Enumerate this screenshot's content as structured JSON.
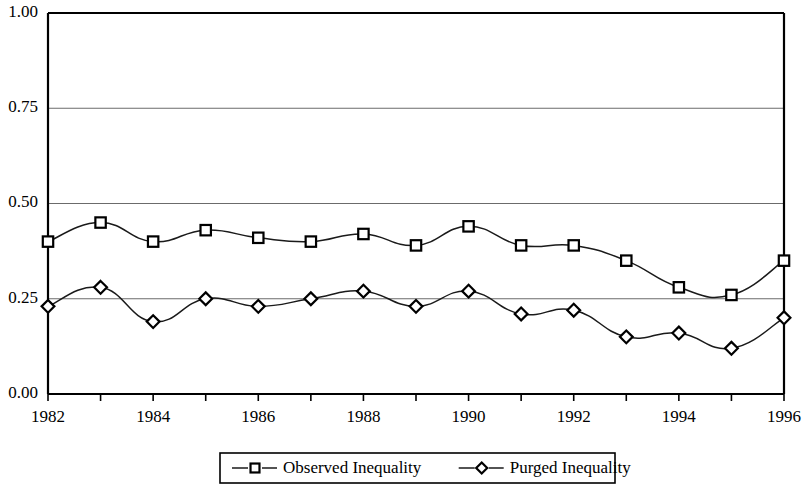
{
  "chart_data": {
    "type": "line",
    "title": "",
    "xlabel": "",
    "ylabel": "",
    "x": [
      1982,
      1983,
      1984,
      1985,
      1986,
      1987,
      1988,
      1989,
      1990,
      1991,
      1992,
      1993,
      1994,
      1995,
      1996
    ],
    "xlim": [
      1982,
      1996
    ],
    "ylim": [
      0.0,
      1.0
    ],
    "grid": true,
    "gridlines": [
      0.25,
      0.5,
      0.75
    ],
    "legend_position": "bottom",
    "y_tick_labels": [
      "1.00",
      "0.75",
      "0.50",
      "0.25",
      "0.00"
    ],
    "y_tick_values": [
      1.0,
      0.75,
      0.5,
      0.25,
      0.0
    ],
    "x_tick_values": [
      1982,
      1983,
      1984,
      1985,
      1986,
      1987,
      1988,
      1989,
      1990,
      1991,
      1992,
      1993,
      1994,
      1995,
      1996
    ],
    "x_tick_labels": [
      "1982",
      "",
      "1984",
      "",
      "1986",
      "",
      "1988",
      "",
      "1990",
      "",
      "1992",
      "",
      "1994",
      "",
      "1996"
    ],
    "x_labeled_years": [
      "1982",
      "1984",
      "1986",
      "1988",
      "1990",
      "1992",
      "1994",
      "1996"
    ],
    "series": [
      {
        "name": "Observed Inequality",
        "marker": "square",
        "color": "#1a1a1a",
        "values": [
          0.4,
          0.45,
          0.4,
          0.43,
          0.41,
          0.4,
          0.42,
          0.39,
          0.44,
          0.39,
          0.39,
          0.35,
          0.28,
          0.26,
          0.35
        ]
      },
      {
        "name": "Purged Inequality",
        "marker": "diamond",
        "color": "#1a1a1a",
        "values": [
          0.23,
          0.28,
          0.19,
          0.25,
          0.23,
          0.25,
          0.27,
          0.23,
          0.27,
          0.21,
          0.22,
          0.15,
          0.16,
          0.12,
          0.2
        ]
      }
    ]
  },
  "legend": {
    "entries": [
      {
        "label": "Observed Inequality",
        "marker": "square"
      },
      {
        "label": "Purged Inequality",
        "marker": "diamond"
      }
    ]
  }
}
